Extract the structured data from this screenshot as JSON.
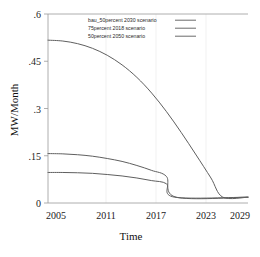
{
  "chart_data": {
    "type": "line",
    "title": "",
    "xlabel": "Time",
    "ylabel": "MW/Month",
    "xlim": [
      2005,
      2032
    ],
    "ylim": [
      -0.02,
      0.63
    ],
    "xticks": [
      "2005",
      "2011",
      "2017",
      "2023",
      "2029"
    ],
    "xtick_values": [
      2005,
      2011,
      2017,
      2023,
      2029
    ],
    "yticks": [
      "0",
      ".15",
      ".3",
      ".45",
      ".6"
    ],
    "ytick_values": [
      0,
      0.15,
      0.3,
      0.45,
      0.6
    ],
    "grid": true,
    "legend_position": "top-center",
    "x": [
      2005,
      2007,
      2009,
      2011,
      2013,
      2015,
      2017,
      2019,
      2021,
      2023,
      2025,
      2027,
      2029,
      2031
    ],
    "series": [
      {
        "name": "bau_50percent 2030 scenario",
        "color": "#5f5f5f",
        "values": [
          0.54,
          0.537,
          0.528,
          0.512,
          0.488,
          0.455,
          0.412,
          0.358,
          0.294,
          0.222,
          0.145,
          0.066,
          0.0,
          0.0
        ],
        "zero_crossing": 2028.6,
        "start_value": 0.54
      },
      {
        "name": "75percent 2018 scenario",
        "color": "#5f5f5f",
        "values": [
          0.15,
          0.149,
          0.146,
          0.141,
          0.133,
          0.123,
          0.109,
          0.092,
          0.071,
          0.046,
          0.017,
          0.0,
          0.0,
          0.0
        ],
        "zero_crossing": 2022.3,
        "start_value": 0.15
      },
      {
        "name": "50percent 2050 scenario",
        "color": "#5f5f5f",
        "values": [
          0.085,
          0.085,
          0.084,
          0.082,
          0.078,
          0.073,
          0.066,
          0.057,
          0.046,
          0.032,
          0.014,
          0.0,
          0.0,
          0.0
        ],
        "zero_crossing": 2022.1,
        "start_value": 0.085
      }
    ],
    "legend_entries": [
      "bau_50percent 2030 scenario",
      "75percent 2018 scenario",
      "50percent 2050 scenario"
    ]
  },
  "axes": {
    "x_title": "Time",
    "y_title": "MW/Month"
  },
  "colors": {
    "line": "#5f5f5f",
    "frame": "#9a9a9a",
    "grid": "#e8e8e8",
    "text": "#222222",
    "background": "#ffffff"
  }
}
